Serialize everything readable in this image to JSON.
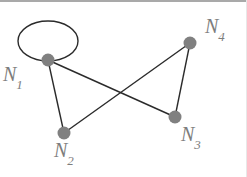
{
  "figure": {
    "type": "graph-diagram",
    "background_color": "#ffffff",
    "width": 247,
    "height": 177,
    "node_color": "#808080",
    "edge_color": "#2b2b2b",
    "label_color": "#7d7d7d",
    "top_band_color": "#a9a9a9"
  },
  "graph": {
    "nodes": [
      {
        "id": "N1",
        "label": "N",
        "subscript": "1",
        "x": 48,
        "y": 60,
        "r": 6.5
      },
      {
        "id": "N2",
        "label": "N",
        "subscript": "2",
        "x": 64,
        "y": 133,
        "r": 6.5
      },
      {
        "id": "N3",
        "label": "N",
        "subscript": "3",
        "x": 175,
        "y": 117,
        "r": 6.5
      },
      {
        "id": "N4",
        "label": "N",
        "subscript": "4",
        "x": 190,
        "y": 43,
        "r": 6.5
      }
    ],
    "edges": [
      {
        "from": "N1",
        "to": "N2"
      },
      {
        "from": "N1",
        "to": "N3"
      },
      {
        "from": "N2",
        "to": "N4"
      },
      {
        "from": "N3",
        "to": "N4"
      }
    ],
    "self_loops": [
      {
        "node": "N1",
        "cx": 48,
        "cy": 41,
        "rx": 30,
        "ry": 20
      }
    ],
    "crossing_point": {
      "x": 120,
      "y": 93
    }
  },
  "labels": {
    "n1": {
      "base": "N",
      "sub": "1"
    },
    "n2": {
      "base": "N",
      "sub": "2"
    },
    "n3": {
      "base": "N",
      "sub": "3"
    },
    "n4": {
      "base": "N",
      "sub": "4"
    }
  }
}
